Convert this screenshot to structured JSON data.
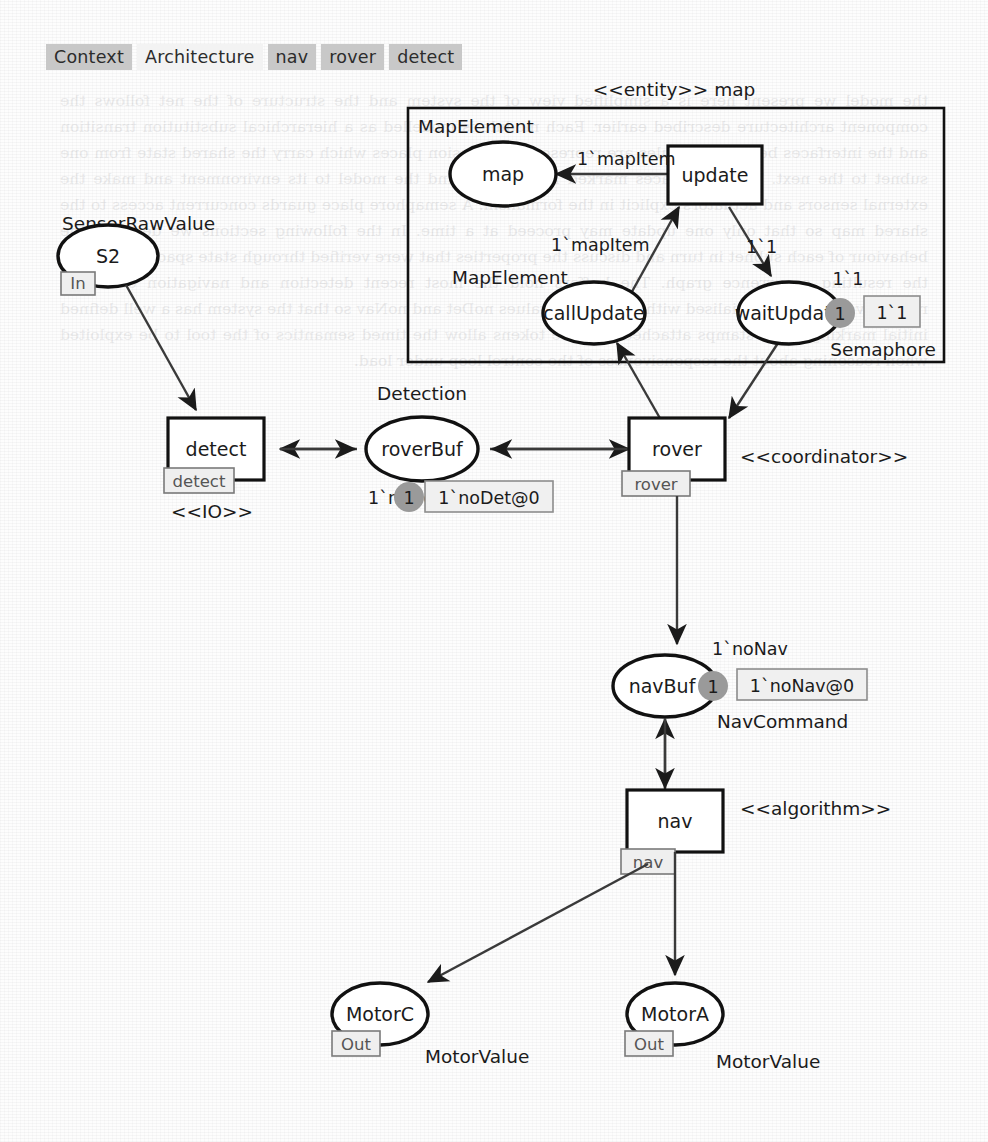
{
  "tabs": [
    {
      "label": "Context",
      "selected": false
    },
    {
      "label": "Architecture",
      "selected": true
    },
    {
      "label": "nav",
      "selected": false
    },
    {
      "label": "rover",
      "selected": false
    },
    {
      "label": "detect",
      "selected": false
    }
  ],
  "diagram": {
    "type": "coloured-petri-net",
    "entity_box": {
      "title": "<<entity>> map",
      "inner_label": "MapElement"
    },
    "places": [
      {
        "id": "s2",
        "name": "S2",
        "colorset": "SensorRawValue",
        "port": "In",
        "tokens": null,
        "marking": null
      },
      {
        "id": "map",
        "name": "map",
        "colorset": "MapElement",
        "port": null,
        "tokens": null,
        "marking": null
      },
      {
        "id": "callupdate",
        "name": "callUpdate",
        "colorset": "MapElement",
        "port": null,
        "tokens": null,
        "marking": null
      },
      {
        "id": "waitupdate",
        "name": "waitUpdate",
        "colorset": "Semaphore",
        "port": null,
        "tokens": "1",
        "marking": "1`1",
        "marking_above": "1`1"
      },
      {
        "id": "roverbuf",
        "name": "roverBuf",
        "colorset": "Detection",
        "port": null,
        "tokens": "1",
        "marking": "1`noDet@0",
        "marking_above": "1`noDet"
      },
      {
        "id": "navbuf",
        "name": "navBuf",
        "colorset": "NavCommand",
        "port": null,
        "tokens": "1",
        "marking": "1`noNav@0",
        "marking_above": "1`noNav"
      },
      {
        "id": "motorc",
        "name": "MotorC",
        "colorset": "MotorValue",
        "port": "Out",
        "tokens": null,
        "marking": null
      },
      {
        "id": "motora",
        "name": "MotorA",
        "colorset": "MotorValue",
        "port": "Out",
        "tokens": null,
        "marking": null
      }
    ],
    "transitions": [
      {
        "id": "detect",
        "name": "detect",
        "substitution_tag": "detect",
        "stereotype": "<<IO>>"
      },
      {
        "id": "update",
        "name": "update",
        "substitution_tag": null,
        "stereotype": null
      },
      {
        "id": "rover",
        "name": "rover",
        "substitution_tag": "rover",
        "stereotype": "<<coordinator>>"
      },
      {
        "id": "nav",
        "name": "nav",
        "substitution_tag": "nav",
        "stereotype": "<<algorithm>>"
      }
    ],
    "arc_inscriptions": [
      {
        "id": "a1",
        "text": "1`mapItem",
        "from": "update",
        "to": "map"
      },
      {
        "id": "a2",
        "text": "1`mapItem",
        "from": "callUpdate",
        "to": "update"
      },
      {
        "id": "a3",
        "text": "1`1",
        "from": "update",
        "to": "waitUpdate"
      }
    ],
    "bleed_text": "the model we present here is a simplified view of the system and the structure of the net follows the component architecture described earlier. Each module is modelled as a hierarchical substitution transition and the interfaces between modules are represented by fusion places which carry the shared state from one subnet to the next. The port places marked In and Out bind the model to its environment and make the external sensors and actuators explicit in the formalism. A semaphore place guards concurrent access to the shared map so that only one update may proceed at a time. In the following sections we describe the behaviour of each subnet in turn and discuss the properties that were verified through state space analysis of the resulting occurrence graph. The buffers hold the most recent detection and navigation command respectively and are initialised with the neutral values noDet and noNav so that the system has a well defined initial marking. Time stamps attached to these tokens allow the timed semantics of the tool to be exploited when reasoning about the responsiveness of the control loop under load."
  }
}
